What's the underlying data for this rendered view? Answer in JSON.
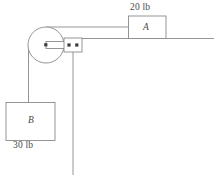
{
  "figure": {
    "canvas": {
      "width": 214,
      "height": 175
    },
    "colors": {
      "stroke": "#8a8a8a",
      "text": "#4a4a4a",
      "pin": "#3c3c3c",
      "background": "#ffffff"
    }
  },
  "blocks": [
    {
      "id": "A",
      "label": "A",
      "weight": "20 lb",
      "position": {
        "x": 128,
        "y": 16,
        "width": 38,
        "height": 22
      },
      "support": "horizontal-surface"
    },
    {
      "id": "B",
      "label": "B",
      "weight": "30 lb",
      "position": {
        "x": 6,
        "y": 102,
        "width": 49,
        "height": 38
      },
      "support": "hanging-from-cord"
    }
  ],
  "pulley": {
    "name": "pulley",
    "center": {
      "x": 46,
      "y": 45
    },
    "radius": 18,
    "axle_pin": true
  },
  "collar": {
    "name": "collar",
    "position": {
      "x": 64,
      "y": 38,
      "width": 18,
      "height": 14
    },
    "pin_count": 2
  },
  "connecting_rod": {
    "name": "connecting-rod",
    "from": {
      "x": 46,
      "y": 45
    },
    "to": {
      "x": 64,
      "y": 45
    }
  },
  "cords": [
    {
      "name": "cord-pulley-to-block-a",
      "from": {
        "x": 46,
        "y": 27
      },
      "to": {
        "x": 128,
        "y": 27
      }
    },
    {
      "name": "cord-pulley-to-block-b",
      "from": {
        "x": 28,
        "y": 45
      },
      "to": {
        "x": 28,
        "y": 102
      }
    },
    {
      "name": "cord-vertical-drop",
      "from": {
        "x": 73,
        "y": 52
      },
      "to": {
        "x": 73,
        "y": 175
      }
    }
  ],
  "surface": {
    "name": "ground-surface",
    "from": {
      "x": 82,
      "y": 38
    },
    "to": {
      "x": 214,
      "y": 38
    }
  }
}
